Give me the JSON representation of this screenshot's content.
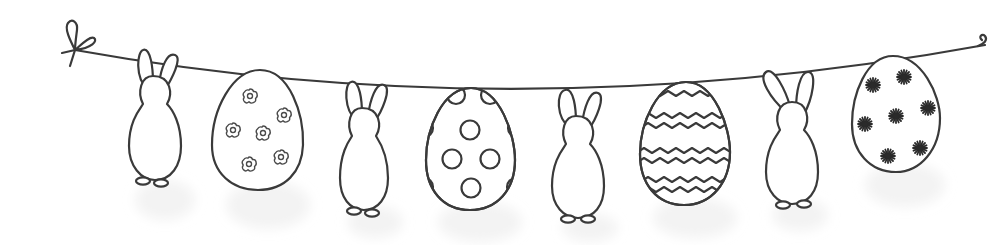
{
  "scene": {
    "title": "Easter bunting garland",
    "background_color": "#ffffff",
    "ink_color": "#3a3a3a",
    "string": {
      "left_knot": {
        "x": 75,
        "y": 50,
        "style": "bow-knot"
      },
      "right_end": {
        "x": 985,
        "y": 45,
        "style": "curl"
      }
    },
    "items": [
      {
        "type": "bunny",
        "index": 1,
        "label": "Bunny 1"
      },
      {
        "type": "egg",
        "index": 1,
        "pattern": "flowers",
        "pattern_count": 6,
        "label": "Flower egg"
      },
      {
        "type": "bunny",
        "index": 2,
        "label": "Bunny 2"
      },
      {
        "type": "egg",
        "index": 2,
        "pattern": "polka-dots",
        "pattern_count": 10,
        "label": "Polka dot egg"
      },
      {
        "type": "bunny",
        "index": 3,
        "label": "Bunny 3"
      },
      {
        "type": "egg",
        "index": 3,
        "pattern": "zigzag-lines",
        "pattern_count": 7,
        "label": "Zigzag egg"
      },
      {
        "type": "bunny",
        "index": 4,
        "label": "Bunny 4"
      },
      {
        "type": "egg",
        "index": 4,
        "pattern": "stars",
        "pattern_count": 7,
        "label": "Star egg"
      }
    ]
  }
}
